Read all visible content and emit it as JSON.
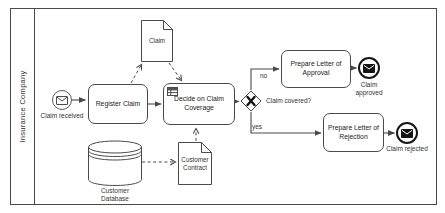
{
  "pool": {
    "label": "Insurance Company"
  },
  "events": {
    "start": {
      "label": "Claim received",
      "icon": "envelope-outline-icon"
    },
    "end_approved": {
      "label": "Claim approved",
      "icon": "envelope-filled-icon"
    },
    "end_rejected": {
      "label": "Claim rejected",
      "icon": "envelope-filled-icon"
    }
  },
  "tasks": {
    "register_claim": {
      "label": "Register Claim"
    },
    "decide_coverage": {
      "label": "Decide on Claim Coverage",
      "icon": "business-rule-table-icon"
    },
    "prepare_approval": {
      "label": "Prepare Letter of Approval"
    },
    "prepare_rejection": {
      "label": "Prepare Letter of Rejection"
    }
  },
  "gateway": {
    "question": "Claim covered?",
    "symbol": "X",
    "branch_no": "no",
    "branch_yes": "yes"
  },
  "data_objects": {
    "claim_doc": {
      "label": "Claim"
    },
    "customer_contract": {
      "label": "Customer Contract"
    }
  },
  "data_stores": {
    "customer_database": {
      "label": "Customer Database"
    }
  },
  "colors": {
    "line": "#4a4a4a",
    "text": "#222222",
    "node_fill": "#ffffff",
    "background": "#ffffff"
  }
}
